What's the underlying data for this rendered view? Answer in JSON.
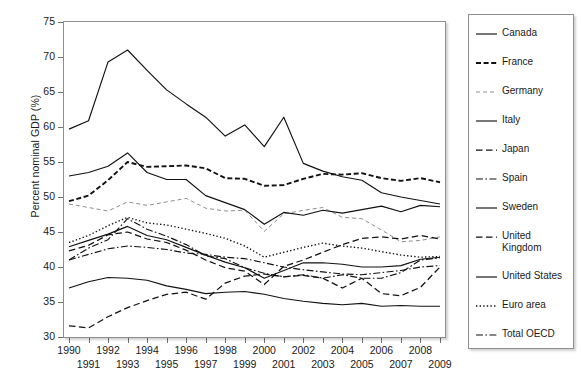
{
  "chart_data": {
    "type": "line",
    "title": "",
    "xlabel": "",
    "ylabel": "Percent nominal GDP (%)",
    "xlim": [
      1990,
      2009
    ],
    "ylim": [
      30,
      75
    ],
    "yticks": [
      30,
      35,
      40,
      45,
      50,
      55,
      60,
      65,
      70,
      75
    ],
    "grid": false,
    "legend_position": "right-outside",
    "x": [
      1990,
      1991,
      1992,
      1993,
      1994,
      1995,
      1996,
      1997,
      1998,
      1999,
      2000,
      2001,
      2002,
      2003,
      2004,
      2005,
      2006,
      2007,
      2008,
      2009
    ],
    "categories": [
      "1990",
      "1991",
      "1992",
      "1993",
      "1994",
      "1995",
      "1996",
      "1997",
      "1998",
      "1999",
      "2000",
      "2001",
      "2002",
      "2003",
      "2004",
      "2005",
      "2006",
      "2007",
      "2008",
      "2009"
    ],
    "series": [
      {
        "name": "Canada",
        "style": "solid",
        "values": [
          59.7,
          60.9,
          69.3,
          71.0,
          68.1,
          65.3,
          63.3,
          61.4,
          58.7,
          60.3,
          57.2,
          61.4,
          54.8,
          53.7,
          52.9,
          52.4,
          50.6,
          50.0,
          49.5,
          49.0
        ]
      },
      {
        "name": "France",
        "style": "dashed",
        "values": [
          49.4,
          50.2,
          52.4,
          55.0,
          54.3,
          54.4,
          54.5,
          54.1,
          52.7,
          52.6,
          51.6,
          51.7,
          52.6,
          53.3,
          53.2,
          53.4,
          52.7,
          52.3,
          52.7,
          52.1
        ]
      },
      {
        "name": "Germany",
        "style": "dashed-light",
        "values": [
          49.0,
          48.5,
          48.0,
          49.3,
          48.8,
          49.3,
          49.8,
          48.4,
          48.0,
          48.1,
          45.1,
          47.6,
          48.1,
          48.5,
          47.1,
          46.9,
          45.3,
          43.6,
          43.8,
          44.3
        ]
      },
      {
        "name": "Italy",
        "style": "solid",
        "values": [
          53.0,
          53.5,
          54.4,
          56.3,
          53.5,
          52.5,
          52.5,
          50.2,
          49.2,
          48.2,
          46.1,
          47.8,
          47.4,
          48.1,
          47.7,
          48.2,
          48.7,
          47.9,
          48.8,
          48.6
        ]
      },
      {
        "name": "Japan",
        "style": "dashed-long",
        "values": [
          31.6,
          31.3,
          32.9,
          34.2,
          35.2,
          36.1,
          36.4,
          35.4,
          37.7,
          38.7,
          39.0,
          38.6,
          38.8,
          38.4,
          37.0,
          38.4,
          36.2,
          35.9,
          37.1,
          40.0
        ]
      },
      {
        "name": "Spain",
        "style": "dash-dot",
        "values": [
          41.0,
          42.7,
          43.9,
          46.9,
          45.4,
          44.4,
          43.2,
          41.6,
          41.2,
          39.9,
          39.1,
          38.6,
          38.9,
          38.4,
          38.9,
          38.4,
          38.4,
          39.2,
          41.0,
          41.3
        ]
      },
      {
        "name": "Sweden",
        "style": "solid",
        "values": [
          37.0,
          37.9,
          38.5,
          38.4,
          38.1,
          37.3,
          36.8,
          36.2,
          36.4,
          36.5,
          36.1,
          35.5,
          35.1,
          34.8,
          34.6,
          34.8,
          34.4,
          34.5,
          34.4,
          34.4
        ]
      },
      {
        "name": "United Kingdom",
        "style": "dashed-long",
        "values": [
          42.3,
          43.1,
          44.6,
          45.0,
          44.0,
          43.5,
          42.4,
          41.0,
          39.9,
          39.4,
          37.5,
          40.1,
          41.0,
          42.1,
          43.2,
          44.1,
          44.3,
          44.0,
          44.5,
          44.0
        ]
      },
      {
        "name": "United States",
        "style": "solid",
        "values": [
          42.9,
          43.8,
          44.7,
          45.8,
          44.5,
          43.9,
          42.8,
          41.7,
          40.7,
          39.9,
          38.4,
          39.5,
          40.6,
          40.6,
          40.4,
          40.0,
          40.0,
          40.2,
          41.1,
          41.4
        ]
      },
      {
        "name": "Euro area",
        "style": "dotted",
        "values": [
          43.5,
          44.5,
          45.9,
          47.1,
          46.3,
          46.0,
          45.4,
          44.8,
          44.1,
          43.0,
          41.4,
          42.1,
          42.8,
          43.4,
          43.0,
          42.7,
          42.2,
          41.7,
          41.4,
          41.5
        ]
      },
      {
        "name": "Total OECD",
        "style": "dash-dot",
        "values": [
          41.0,
          41.8,
          42.6,
          43.0,
          42.8,
          42.5,
          42.0,
          41.8,
          41.4,
          41.2,
          40.6,
          40.0,
          39.6,
          39.3,
          39.0,
          38.9,
          39.2,
          39.5,
          40.0,
          40.2
        ]
      }
    ]
  },
  "axes": {
    "y_title": "Percent nominal GDP (%)"
  }
}
